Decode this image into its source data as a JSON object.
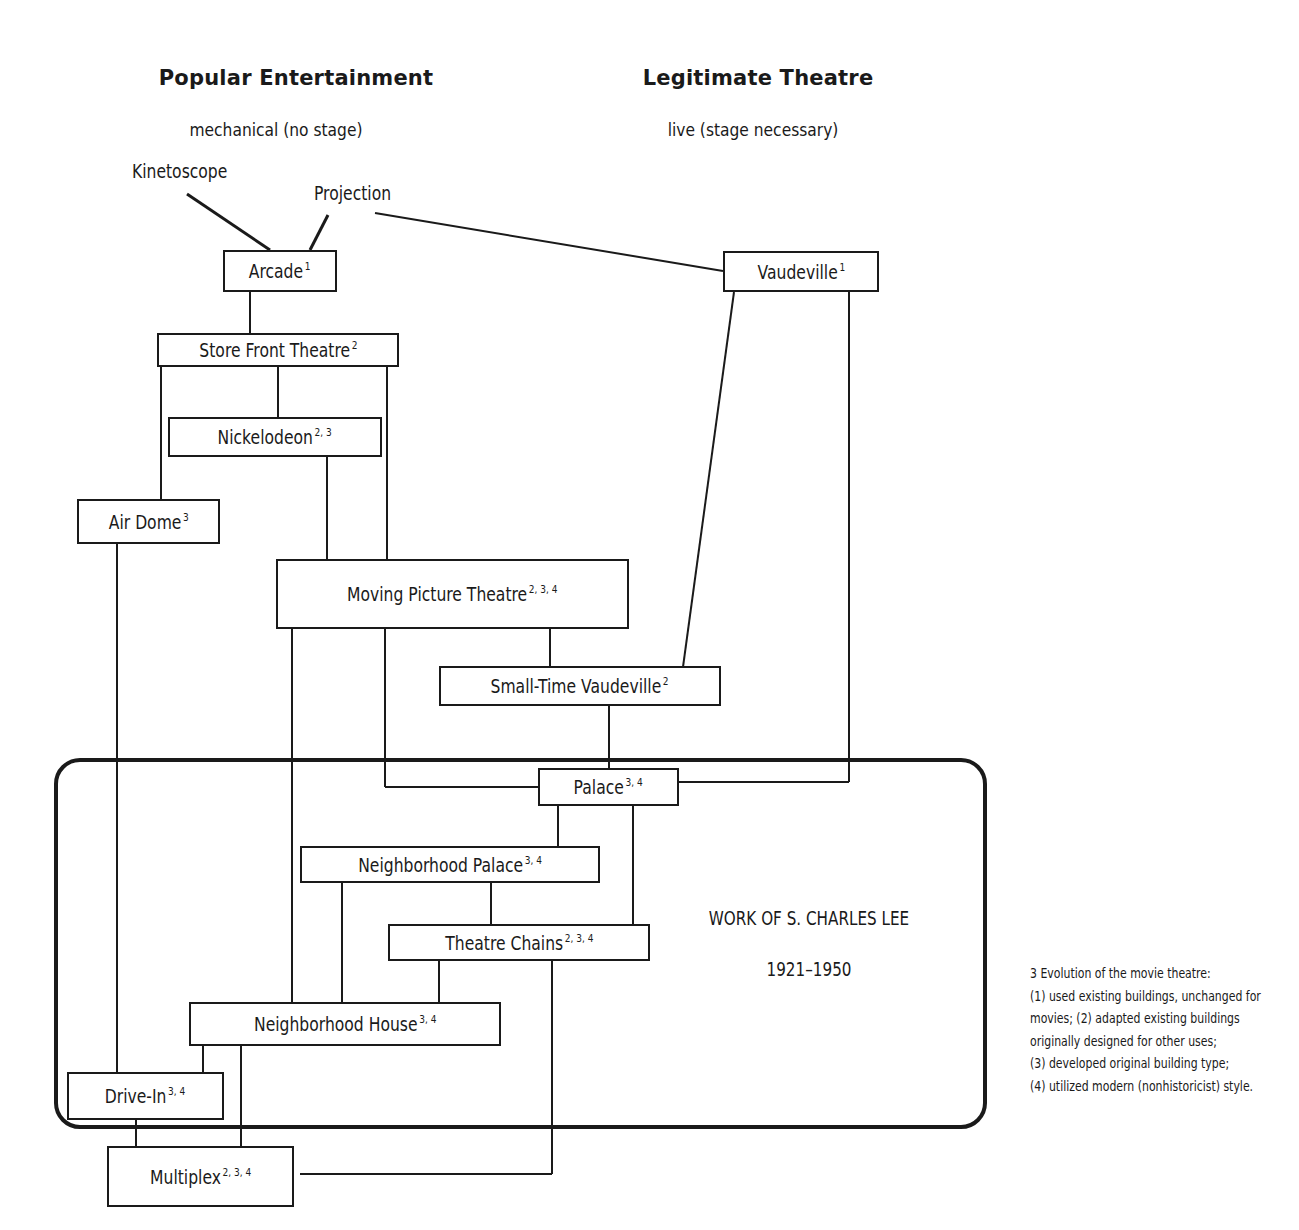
{
  "headings": {
    "left_title": "Popular Entertainment",
    "left_subtitle": "mechanical (no stage)",
    "right_title": "Legitimate Theatre",
    "right_subtitle": "live (stage necessary)"
  },
  "origins": {
    "kinetoscope": "Kinetoscope",
    "projection": "Projection"
  },
  "nodes": {
    "arcade": {
      "label": "Arcade",
      "notes": "1"
    },
    "vaudeville": {
      "label": "Vaudeville",
      "notes": "1"
    },
    "store_front": {
      "label": "Store Front Theatre",
      "notes": "2"
    },
    "nickelodeon": {
      "label": "Nickelodeon",
      "notes": "2, 3"
    },
    "air_dome": {
      "label": "Air Dome",
      "notes": "3"
    },
    "moving_picture": {
      "label": "Moving Picture Theatre",
      "notes": "2, 3, 4"
    },
    "small_time_vaudeville": {
      "label": "Small-Time Vaudeville",
      "notes": "2"
    },
    "palace": {
      "label": "Palace",
      "notes": "3, 4"
    },
    "neighborhood_palace": {
      "label": "Neighborhood Palace",
      "notes": "3, 4"
    },
    "theatre_chains": {
      "label": "Theatre Chains",
      "notes": "2, 3, 4"
    },
    "neighborhood_house": {
      "label": "Neighborhood House",
      "notes": "3, 4"
    },
    "drive_in": {
      "label": "Drive-In",
      "notes": "3, 4"
    },
    "multiplex": {
      "label": "Multiplex",
      "notes": "2, 3, 4"
    }
  },
  "lee_region": {
    "title": "WORK OF S. CHARLES LEE",
    "years": "1921–1950"
  },
  "caption": {
    "lines": [
      "3  Evolution of the movie theatre:",
      "(1) used existing buildings, unchanged for",
      "movies; (2) adapted existing buildings",
      "originally designed for other uses;",
      "(3) developed original building type;",
      "(4) utilized modern (nonhistoricist) style."
    ]
  },
  "colors": {
    "ink": "#1a1a1a",
    "background": "#ffffff"
  }
}
